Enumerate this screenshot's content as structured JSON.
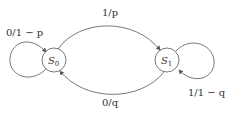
{
  "diagram": {
    "type": "state-machine",
    "states": [
      {
        "id": "S0",
        "label": "S",
        "sub": "0"
      },
      {
        "id": "S1",
        "label": "S",
        "sub": "1"
      }
    ],
    "transitions": [
      {
        "from": "S0",
        "to": "S1",
        "label": "1/p"
      },
      {
        "from": "S1",
        "to": "S0",
        "label": "0/q"
      },
      {
        "from": "S0",
        "to": "S0",
        "label": "0/1 − p"
      },
      {
        "from": "S1",
        "to": "S1",
        "label": "1/1 − q"
      }
    ],
    "colors": {
      "stroke": "#555555",
      "text": "#333333",
      "background": "#ffffff"
    }
  }
}
